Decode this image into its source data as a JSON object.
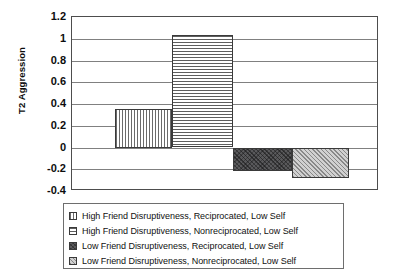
{
  "chart_data": {
    "type": "bar",
    "title": "",
    "xlabel": "",
    "ylabel": "T2 Aggression",
    "ylim": [
      -0.4,
      1.2
    ],
    "ytick_labels": [
      "1.2",
      "1",
      "0.8",
      "0.6",
      "0.4",
      "0.2",
      "0",
      "-0.2",
      "-0.4"
    ],
    "ytick_values": [
      1.2,
      1,
      0.8,
      0.6,
      0.4,
      0.2,
      0,
      -0.2,
      -0.4
    ],
    "grid": true,
    "legend_position": "below",
    "categories": [
      "High Friend Disruptiveness, Reciprocated, Low Self",
      "High Friend Disruptiveness, Nonreciprocated, Low Self",
      "Low Friend Disruptiveness, Reciprocated, Low Self",
      "Low Friend Disruptiveness, Nonreciprocated, Low Self"
    ],
    "values": [
      0.35,
      1.03,
      -0.22,
      -0.28
    ],
    "bars": [
      {
        "label": "High Friend Disruptiveness, Reciprocated, Low Self",
        "value": 0.35,
        "pattern": "vertical-lines"
      },
      {
        "label": "High Friend Disruptiveness, Nonreciprocated, Low Self",
        "value": 1.03,
        "pattern": "horizontal-lines"
      },
      {
        "label": "Low Friend Disruptiveness, Reciprocated, Low Self",
        "value": -0.22,
        "pattern": "dark-diagonal-crosshatch"
      },
      {
        "label": "Low Friend Disruptiveness, Nonreciprocated, Low Self",
        "value": -0.28,
        "pattern": "light-diagonal-hatch"
      }
    ]
  },
  "axis": {
    "y_title": "T2 Aggression"
  },
  "legend": {
    "items": [
      {
        "label": "High Friend Disruptiveness, Reciprocated, Low Self"
      },
      {
        "label": "High Friend Disruptiveness, Nonreciprocated, Low Self"
      },
      {
        "label": "Low Friend Disruptiveness, Reciprocated, Low Self"
      },
      {
        "label": "Low Friend Disruptiveness, Nonreciprocated, Low Self"
      }
    ]
  },
  "colors": {
    "axis": "#4d4d4d",
    "gridline": "#808080",
    "bar_outline": "#3a3a3a",
    "bar_dark": "#59595b",
    "bar_light": "#b8b8b8",
    "text": "#0d0d0d",
    "background": "#ffffff"
  }
}
